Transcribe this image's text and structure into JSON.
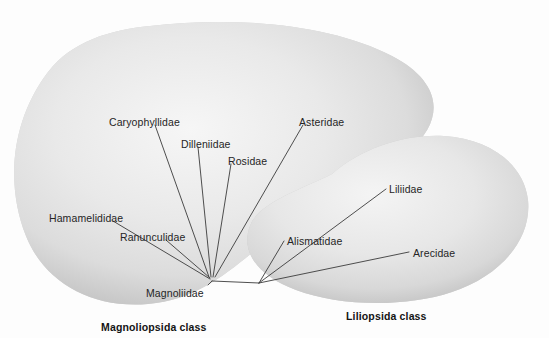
{
  "diagram": {
    "background_color": "#fdfdfd",
    "blob_fill_light": "#efefef",
    "blob_fill_mid": "#d9d9d9",
    "blob_edge_shadow": "#a8a8a8",
    "line_color": "#3b3b3b",
    "text_color": "#252525"
  },
  "classes": [
    {
      "id": "magnoliopsida",
      "label": "Magnoliopsida class",
      "x": 101,
      "y": 322
    },
    {
      "id": "liliopsida",
      "label": "Liliopsida class",
      "x": 346,
      "y": 311
    }
  ],
  "nodes": {
    "magnoliopsida_root": {
      "label": "Magnoliidae",
      "x": 212,
      "y": 281
    },
    "liliopsida_root": {
      "label": "",
      "x": 259,
      "y": 283
    }
  },
  "subclasses": [
    {
      "id": "caryophyllidae",
      "label": "Caryophyllidae",
      "class": "magnoliopsida",
      "label_x": 109,
      "label_y": 117,
      "line": {
        "x1": 155,
        "y1": 125,
        "x2": 209,
        "y2": 277
      }
    },
    {
      "id": "dilleniidae",
      "label": "Dilleniidae",
      "class": "magnoliopsida",
      "label_x": 181,
      "label_y": 139,
      "line": {
        "x1": 198,
        "y1": 147,
        "x2": 211,
        "y2": 277
      }
    },
    {
      "id": "rosidae",
      "label": "Rosidae",
      "class": "magnoliopsida",
      "label_x": 228,
      "label_y": 156,
      "line": {
        "x1": 231,
        "y1": 164,
        "x2": 213,
        "y2": 277
      }
    },
    {
      "id": "asteridae",
      "label": "Asteridae",
      "class": "magnoliopsida",
      "label_x": 299,
      "label_y": 117,
      "line": {
        "x1": 303,
        "y1": 125,
        "x2": 215,
        "y2": 277
      }
    },
    {
      "id": "hamamelididae",
      "label": "Hamamelididae",
      "class": "magnoliopsida",
      "label_x": 49,
      "label_y": 213,
      "line": {
        "x1": 113,
        "y1": 221,
        "x2": 210,
        "y2": 279
      }
    },
    {
      "id": "ranunculidae",
      "label": "Ranunculidae",
      "class": "magnoliopsida",
      "label_x": 120,
      "label_y": 232,
      "line": {
        "x1": 166,
        "y1": 240,
        "x2": 210,
        "y2": 278
      }
    },
    {
      "id": "magnoliidae",
      "label": "Magnoliidae",
      "class": "magnoliopsida",
      "label_x": 146,
      "label_y": 288,
      "line": {
        "x1": 208,
        "y1": 285,
        "x2": 212,
        "y2": 281
      }
    },
    {
      "id": "liliidae",
      "label": "Liliidae",
      "class": "liliopsida",
      "label_x": 389,
      "label_y": 184,
      "line": {
        "x1": 386,
        "y1": 189,
        "x2": 259,
        "y2": 283
      }
    },
    {
      "id": "alismatidae",
      "label": "Alismatidae",
      "class": "liliopsida",
      "label_x": 287,
      "label_y": 236,
      "line": {
        "x1": 284,
        "y1": 241,
        "x2": 259,
        "y2": 283
      }
    },
    {
      "id": "arecidae",
      "label": "Arecidae",
      "class": "liliopsida",
      "label_x": 413,
      "label_y": 248,
      "line": {
        "x1": 409,
        "y1": 252,
        "x2": 259,
        "y2": 283
      }
    }
  ],
  "connector": {
    "id": "class-link",
    "from": "magnoliopsida_root",
    "to": "liliopsida_root"
  }
}
